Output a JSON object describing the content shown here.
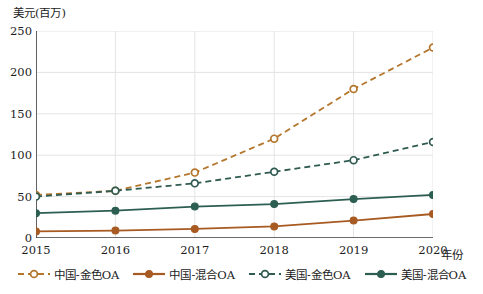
{
  "chart_data": {
    "type": "line",
    "title": "",
    "xlabel": "年份",
    "ylabel": "美元(百万)",
    "x": [
      "2015",
      "2016",
      "2017",
      "2018",
      "2019",
      "2020"
    ],
    "xlim": [
      2015,
      2020
    ],
    "ylim": [
      0,
      250
    ],
    "yticks": [
      "0",
      "50",
      "100",
      "150",
      "200",
      "250"
    ],
    "ytick_values": [
      0,
      50,
      100,
      150,
      200,
      250
    ],
    "grid": true,
    "legend_position": "bottom",
    "series": [
      {
        "name": "中国-金色OA",
        "values": [
          52,
          57,
          79,
          120,
          180,
          230
        ],
        "color": "#b4762c",
        "style": "dashed",
        "marker": "open-circle"
      },
      {
        "name": "中国-混合OA",
        "values": [
          8,
          9,
          11,
          14,
          21,
          29
        ],
        "color": "#a75a22",
        "style": "solid",
        "marker": "filled-circle"
      },
      {
        "name": "美国-金色OA",
        "values": [
          50,
          57,
          66,
          80,
          94,
          116
        ],
        "color": "#2f5b51",
        "style": "dashed",
        "marker": "open-circle"
      },
      {
        "name": "美国-混合OA",
        "values": [
          30,
          33,
          38,
          41,
          47,
          52
        ],
        "color": "#2d5e52",
        "style": "solid",
        "marker": "filled-circle"
      }
    ]
  },
  "colors": {
    "axis": "#3a3a3a",
    "grid": "#e4e4e4",
    "text": "#1c1c1c",
    "background": "#ffffff"
  }
}
